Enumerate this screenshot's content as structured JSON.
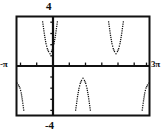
{
  "chart_data": {
    "type": "scatter",
    "title": "",
    "subtitle": "",
    "xlabel": "",
    "ylabel": "",
    "xlim": [
      -3.14159,
      9.42478
    ],
    "ylim": [
      -4,
      4
    ],
    "grid": false,
    "legend": null,
    "style": "dotted-plot",
    "axis_labels": {
      "ymax": "4",
      "ymin": "-4",
      "xmin": "-π",
      "xmax": "3π"
    },
    "x_tick_values": [
      -3.14159,
      -1.5708,
      0,
      1.5708,
      3.14159,
      4.71239,
      6.28319,
      7.85398,
      9.42478
    ],
    "y_tick_values": [
      -4,
      -3,
      -2,
      -1,
      0,
      1,
      2,
      3,
      4
    ],
    "series": [
      {
        "name": "branch-upper-left",
        "region": "above-axis",
        "shape": "U",
        "points": [
          {
            "x": -0.7,
            "y": 3.6
          },
          {
            "x": -0.52,
            "y": 2.5
          },
          {
            "x": -0.38,
            "y": 1.82
          },
          {
            "x": -0.26,
            "y": 1.42
          },
          {
            "x": -0.14,
            "y": 1.18
          },
          {
            "x": 0.0,
            "y": 1.0
          },
          {
            "x": 0.14,
            "y": 1.18
          },
          {
            "x": 0.26,
            "y": 1.42
          },
          {
            "x": 0.38,
            "y": 1.82
          },
          {
            "x": 0.52,
            "y": 2.5
          },
          {
            "x": 0.7,
            "y": 3.6
          }
        ]
      },
      {
        "name": "branch-upper-right",
        "region": "above-axis",
        "shape": "U",
        "points": [
          {
            "x": 5.58,
            "y": 3.6
          },
          {
            "x": 5.76,
            "y": 2.5
          },
          {
            "x": 5.9,
            "y": 1.82
          },
          {
            "x": 6.02,
            "y": 1.42
          },
          {
            "x": 6.14,
            "y": 1.18
          },
          {
            "x": 6.28,
            "y": 1.0
          },
          {
            "x": 6.42,
            "y": 1.18
          },
          {
            "x": 6.54,
            "y": 1.42
          },
          {
            "x": 6.66,
            "y": 1.82
          },
          {
            "x": 6.8,
            "y": 2.5
          },
          {
            "x": 6.98,
            "y": 3.6
          }
        ]
      },
      {
        "name": "branch-lower-left",
        "region": "below-axis",
        "shape": "inverted-U-partial",
        "points": [
          {
            "x": -3.14159,
            "y": -1.4
          },
          {
            "x": -3.0,
            "y": -1.55
          },
          {
            "x": -2.86,
            "y": -1.8
          },
          {
            "x": -2.74,
            "y": -2.2
          },
          {
            "x": -2.62,
            "y": -2.85
          },
          {
            "x": -2.5,
            "y": -3.6
          }
        ]
      },
      {
        "name": "branch-lower-middle",
        "region": "below-axis",
        "shape": "inverted-U",
        "points": [
          {
            "x": 2.44,
            "y": -3.6
          },
          {
            "x": 2.62,
            "y": -2.5
          },
          {
            "x": 2.76,
            "y": -1.82
          },
          {
            "x": 2.88,
            "y": -1.42
          },
          {
            "x": 3.0,
            "y": -1.18
          },
          {
            "x": 3.14159,
            "y": -1.0
          },
          {
            "x": 3.28,
            "y": -1.18
          },
          {
            "x": 3.4,
            "y": -1.42
          },
          {
            "x": 3.52,
            "y": -1.82
          },
          {
            "x": 3.66,
            "y": -2.5
          },
          {
            "x": 3.84,
            "y": -3.6
          }
        ]
      },
      {
        "name": "branch-lower-right",
        "region": "below-axis",
        "shape": "inverted-U-partial",
        "points": [
          {
            "x": 8.78,
            "y": -3.6
          },
          {
            "x": 8.9,
            "y": -2.85
          },
          {
            "x": 9.02,
            "y": -2.2
          },
          {
            "x": 9.14,
            "y": -1.8
          },
          {
            "x": 9.28,
            "y": -1.55
          },
          {
            "x": 9.42478,
            "y": -1.4
          }
        ]
      }
    ],
    "colors": {
      "axis": "#111111",
      "frame": "#111111",
      "data": "#111111",
      "background": "#ffffff"
    }
  }
}
